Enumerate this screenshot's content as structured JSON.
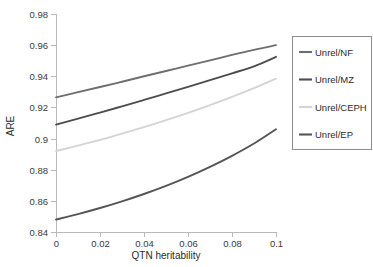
{
  "chart_data": {
    "type": "line",
    "title": "",
    "subtitle": "",
    "xlabel": "QTN heritability",
    "ylabel": "ARE",
    "xlim": [
      0,
      0.1
    ],
    "ylim": [
      0.84,
      0.98
    ],
    "xticks": [
      0,
      0.02,
      0.04,
      0.06,
      0.08,
      0.1
    ],
    "xtick_labels": [
      "0",
      "0.02",
      "0.04",
      "0.06",
      "0.08",
      "0.1"
    ],
    "yticks": [
      0.84,
      0.86,
      0.88,
      0.9,
      0.92,
      0.94,
      0.96,
      0.98
    ],
    "ytick_labels": [
      "0.84",
      "0.86",
      "0.88",
      "0.9",
      "0.92",
      "0.94",
      "0.96",
      "0.98"
    ],
    "grid": false,
    "legend_position": "right",
    "x": [
      0,
      0.01,
      0.02,
      0.03,
      0.04,
      0.05,
      0.06,
      0.07,
      0.08,
      0.09,
      0.1
    ],
    "series": [
      {
        "name": "Unrel/NF",
        "color": "#6e6e6e",
        "values": [
          0.9265,
          0.9298,
          0.9331,
          0.9365,
          0.94,
          0.9434,
          0.9468,
          0.9502,
          0.9537,
          0.957,
          0.96
        ]
      },
      {
        "name": "Unrel/MZ",
        "color": "#4d4d4d",
        "values": [
          0.909,
          0.9128,
          0.9167,
          0.9207,
          0.9248,
          0.929,
          0.9332,
          0.9375,
          0.9419,
          0.9464,
          0.9525
        ]
      },
      {
        "name": "Unrel/CEPH",
        "color": "#d4d4d4",
        "values": [
          0.892,
          0.8955,
          0.8992,
          0.9032,
          0.9074,
          0.9118,
          0.9165,
          0.9215,
          0.9268,
          0.9324,
          0.9385
        ]
      },
      {
        "name": "Unrel/EP",
        "color": "#555555",
        "values": [
          0.848,
          0.8515,
          0.8554,
          0.8597,
          0.8644,
          0.8696,
          0.8754,
          0.8818,
          0.8889,
          0.8968,
          0.906
        ]
      }
    ]
  },
  "legend": {
    "entries": [
      {
        "label": "Unrel/NF"
      },
      {
        "label": "Unrel/MZ"
      },
      {
        "label": "Unrel/CEPH"
      },
      {
        "label": "Unrel/EP"
      }
    ]
  },
  "axes": {
    "y_title": "ARE",
    "x_title": "QTN heritability"
  }
}
